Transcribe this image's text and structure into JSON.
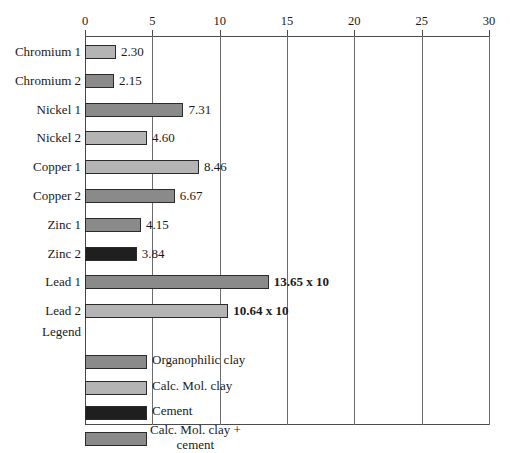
{
  "chart_data": {
    "type": "bar",
    "orientation": "horizontal",
    "title": "",
    "xlabel": "",
    "ylabel": "",
    "xlim": [
      0,
      30
    ],
    "grid": true,
    "legend_position": "inside-bottom-left",
    "tick_labels": [
      "0",
      "5",
      "10",
      "15",
      "20",
      "25",
      "30"
    ],
    "tick_values": [
      0,
      5,
      10,
      15,
      20,
      25,
      30
    ],
    "categories": [
      "Chromium 1",
      "Chromium 2",
      "Nickel 1",
      "Nickel 2",
      "Copper 1",
      "Copper 2",
      "Zinc 1",
      "Zinc 2",
      "Lead 1",
      "Lead 2"
    ],
    "values": [
      2.3,
      2.15,
      7.31,
      4.6,
      8.46,
      6.67,
      4.15,
      3.84,
      13.65,
      10.64
    ],
    "value_labels": [
      "2.30",
      "2.15",
      "7.31",
      "4.60",
      "8.46",
      "6.67",
      "4.15",
      "3.84",
      "13.65 x 10",
      "10.64 x 10"
    ],
    "value_label_bold": [
      false,
      false,
      false,
      false,
      false,
      false,
      false,
      false,
      true,
      true
    ],
    "bar_colors": [
      "#b4b4b4",
      "#8a8a8a",
      "#8a8a8a",
      "#b4b4b4",
      "#b4b4b4",
      "#8a8a8a",
      "#8a8a8a",
      "#201f1f",
      "#8a8a8a",
      "#b4b4b4"
    ],
    "legend": {
      "title": "Legend",
      "entries": [
        {
          "label": "Organophilic clay",
          "color": "#8a8a8a"
        },
        {
          "label": "Calc. Mol. clay",
          "color": "#b4b4b4"
        },
        {
          "label": "Cement",
          "color": "#201f1f"
        },
        {
          "label": "Calc. Mol. clay +\ncement",
          "color": "#8a8a8a"
        }
      ]
    },
    "colors": {
      "axis": "#4a4a4a",
      "gridline": "#6d6d6d",
      "bar_border": "#2b2b2b",
      "text": "#1a1a1a",
      "background": "#ffffff"
    }
  }
}
